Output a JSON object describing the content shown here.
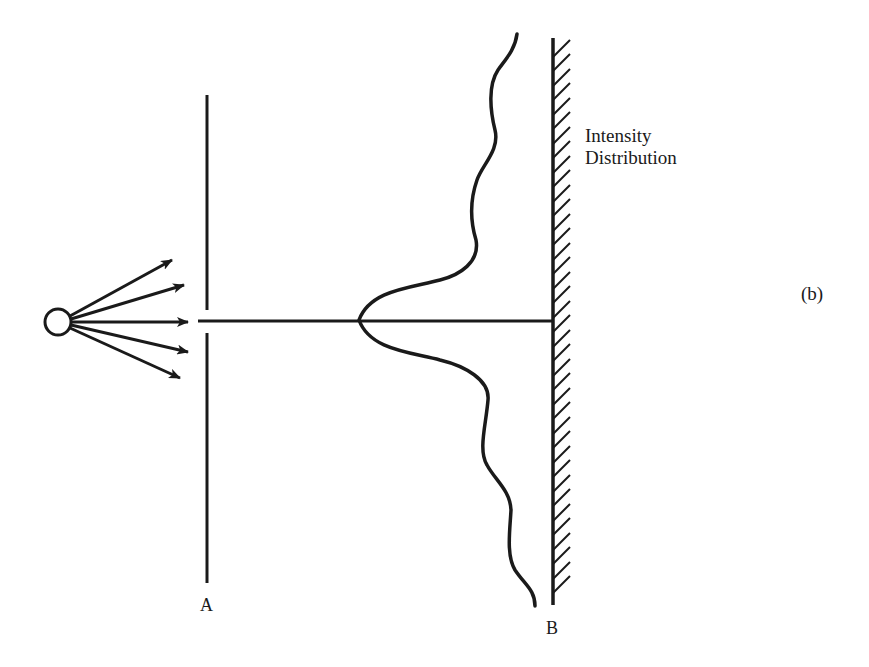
{
  "figure": {
    "panel_label": "(b)",
    "intensity_label_line1": "Intensity",
    "intensity_label_line2": "Distribution",
    "slit_label": "A",
    "screen_label": "B"
  },
  "elements": {
    "source": {
      "icon": "point-source-circle"
    },
    "rays": {
      "count": 5,
      "icon": "arrow-icon"
    },
    "slit_barrier": {
      "label": "A"
    },
    "screen": {
      "label": "B",
      "hatched": true
    },
    "intensity_curve": {
      "type": "single-slit diffraction pattern"
    }
  },
  "colors": {
    "ink": "#1a1a1a",
    "background": "#ffffff"
  }
}
